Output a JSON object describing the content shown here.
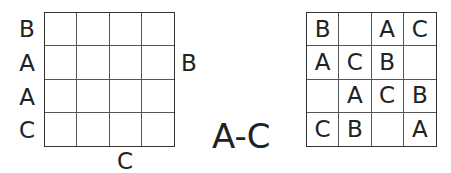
{
  "puzzle": {
    "type": "Easy as ABC",
    "letter_range": "A-C",
    "grid_size": 4,
    "clues": {
      "left": [
        "B",
        "A",
        "A",
        "C"
      ],
      "right": [
        "",
        "B",
        "",
        ""
      ],
      "top": [
        "",
        "",
        "",
        ""
      ],
      "bottom": [
        "",
        "C",
        "",
        ""
      ]
    },
    "puzzle_cells": [
      [
        "",
        "",
        "",
        ""
      ],
      [
        "",
        "",
        "",
        ""
      ],
      [
        "",
        "",
        "",
        ""
      ],
      [
        "",
        "",
        "",
        ""
      ]
    ],
    "solution_cells": [
      [
        "B",
        "",
        "A",
        "C"
      ],
      [
        "A",
        "C",
        "B",
        ""
      ],
      [
        "",
        "A",
        "C",
        "B"
      ],
      [
        "C",
        "B",
        "",
        "A"
      ]
    ]
  }
}
